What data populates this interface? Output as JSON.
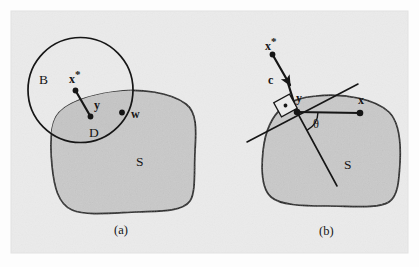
{
  "figure": {
    "caption_a": "(a)",
    "caption_b": "(b)",
    "background_color": "#ebebeb",
    "region_fill_color": "#c9c9c9",
    "stroke_color": "#1a1a1a"
  },
  "panel_a": {
    "name": "panel-a",
    "caption": "(a)",
    "ball_label": "B",
    "set_label": "S",
    "lens_label": "D",
    "center_label": "x",
    "center_label_star": "*",
    "projection_label": "y",
    "boundary_point_label": "w"
  },
  "panel_b": {
    "name": "panel-b",
    "caption": "(b)",
    "set_label": "S",
    "external_point_label": "x",
    "external_point_star": "*",
    "direction_label": "c",
    "projection_label": "y",
    "interior_point_label": "x",
    "angle_label": "θ",
    "right_angle_marker": "·"
  }
}
